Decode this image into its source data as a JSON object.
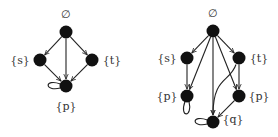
{
  "colors": {
    "node": "#111111",
    "edge": "#222222",
    "label": "#333333"
  },
  "graphs": [
    {
      "id": "left",
      "nodes": [
        {
          "id": "a0",
          "label": "∅",
          "x": 66,
          "y": 32,
          "lx": 66,
          "ly": 14
        },
        {
          "id": "a1",
          "label": "{s}",
          "x": 40,
          "y": 60,
          "lx": 20,
          "ly": 60
        },
        {
          "id": "a2",
          "label": "{t}",
          "x": 92,
          "y": 60,
          "lx": 112,
          "ly": 60
        },
        {
          "id": "a3",
          "label": "{p}",
          "x": 66,
          "y": 86,
          "lx": 66,
          "ly": 106
        }
      ],
      "edges": [
        {
          "from": "a0",
          "to": "a1"
        },
        {
          "from": "a0",
          "to": "a2"
        },
        {
          "from": "a0",
          "to": "a3"
        },
        {
          "from": "a1",
          "to": "a3"
        },
        {
          "from": "a2",
          "to": "a3"
        }
      ],
      "loops": [
        {
          "node": "a3",
          "side": "left"
        }
      ]
    },
    {
      "id": "right",
      "nodes": [
        {
          "id": "b0",
          "label": "∅",
          "x": 213,
          "y": 31,
          "lx": 213,
          "ly": 13
        },
        {
          "id": "b1",
          "label": "{s}",
          "x": 187,
          "y": 58,
          "lx": 167,
          "ly": 58
        },
        {
          "id": "b2",
          "label": "{t}",
          "x": 239,
          "y": 58,
          "lx": 259,
          "ly": 58
        },
        {
          "id": "b3",
          "label": "{p}",
          "x": 187,
          "y": 96,
          "lx": 167,
          "ly": 96
        },
        {
          "id": "b4",
          "label": "{p}",
          "x": 239,
          "y": 96,
          "lx": 259,
          "ly": 96
        },
        {
          "id": "b5",
          "label": "{q}",
          "x": 213,
          "y": 122,
          "lx": 233,
          "ly": 119
        }
      ],
      "edges": [
        {
          "from": "b0",
          "to": "b1"
        },
        {
          "from": "b0",
          "to": "b2"
        },
        {
          "from": "b0",
          "to": "b3"
        },
        {
          "from": "b0",
          "to": "b4"
        },
        {
          "from": "b0",
          "to": "b5"
        },
        {
          "from": "b1",
          "to": "b3"
        },
        {
          "from": "b2",
          "to": "b4"
        },
        {
          "from": "b2",
          "to": "b5",
          "curved": true
        },
        {
          "from": "b4",
          "to": "b5"
        }
      ],
      "loops": [
        {
          "node": "b3",
          "side": "bottom"
        },
        {
          "node": "b5",
          "side": "left"
        }
      ]
    }
  ]
}
